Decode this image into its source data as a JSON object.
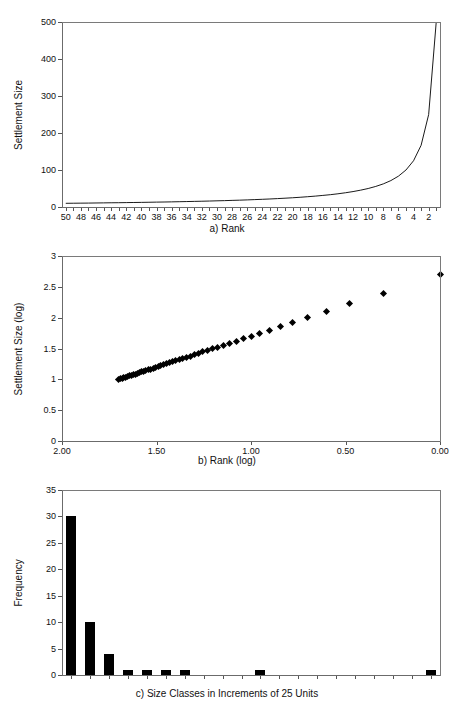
{
  "figure": {
    "background": "#ffffff",
    "axis_color": "#6b6b6b",
    "data_color": "#000000"
  },
  "chart_data": [
    {
      "id": "panel-a",
      "type": "line",
      "title": "",
      "caption": "a) Rank",
      "xlabel": "a) Rank",
      "ylabel": "Settlement Size",
      "xlim": [
        50.5,
        0.5
      ],
      "ylim": [
        0,
        500
      ],
      "x_reversed": true,
      "grid": false,
      "legend": "none",
      "yticks": [
        0,
        100,
        200,
        300,
        400,
        500
      ],
      "ytick_labels": [
        "0",
        "100",
        "200",
        "300",
        "400",
        "500"
      ],
      "xticks": [
        50,
        49,
        48,
        47,
        46,
        45,
        44,
        43,
        42,
        41,
        40,
        39,
        38,
        37,
        36,
        35,
        34,
        33,
        32,
        31,
        30,
        29,
        28,
        27,
        26,
        25,
        24,
        23,
        22,
        21,
        20,
        19,
        18,
        17,
        16,
        15,
        14,
        13,
        12,
        11,
        10,
        9,
        8,
        7,
        6,
        5,
        4,
        3,
        2,
        1
      ],
      "xtick_labels": [
        "50",
        "48",
        "46",
        "44",
        "42",
        "40",
        "38",
        "36",
        "34",
        "32",
        "30",
        "28",
        "26",
        "24",
        "22",
        "20",
        "18",
        "16",
        "14",
        "12",
        "10",
        "8",
        "6",
        "4",
        "2"
      ],
      "series": [
        {
          "name": "Rank-size curve",
          "x": [
            50,
            49,
            48,
            47,
            46,
            45,
            44,
            43,
            42,
            41,
            40,
            39,
            38,
            37,
            36,
            35,
            34,
            33,
            32,
            31,
            30,
            29,
            28,
            27,
            26,
            25,
            24,
            23,
            22,
            21,
            20,
            19,
            18,
            17,
            16,
            15,
            14,
            13,
            12,
            11,
            10,
            9,
            8,
            7,
            6,
            5,
            4,
            3,
            2,
            1
          ],
          "y": [
            10,
            10.2,
            10.4,
            10.6,
            10.9,
            11.1,
            11.4,
            11.6,
            11.9,
            12.2,
            12.5,
            12.8,
            13.2,
            13.5,
            13.9,
            14.3,
            14.7,
            15.2,
            15.6,
            16.1,
            16.7,
            17.2,
            17.9,
            18.5,
            19.2,
            20,
            20.8,
            21.7,
            22.7,
            23.8,
            25,
            26.3,
            27.8,
            29.4,
            31.3,
            33.3,
            35.7,
            38.5,
            41.7,
            45.5,
            50,
            55.6,
            62.5,
            71.4,
            83.3,
            100,
            125,
            166.7,
            250,
            500
          ]
        }
      ]
    },
    {
      "id": "panel-b",
      "type": "scatter",
      "title": "",
      "caption": "b) Rank (log)",
      "xlabel": "b) Rank (log)",
      "ylabel": "Settlement Size (log)",
      "xlim": [
        2.0,
        0.0
      ],
      "ylim": [
        0,
        3
      ],
      "x_reversed": true,
      "grid": false,
      "legend": "none",
      "yticks": [
        0,
        0.5,
        1,
        1.5,
        2,
        2.5,
        3
      ],
      "ytick_labels": [
        "0",
        "0.5",
        "1",
        "1.5",
        "2",
        "2.5",
        "3"
      ],
      "xticks": [
        2.0,
        1.5,
        1.0,
        0.5,
        0.0
      ],
      "xtick_labels": [
        "2.00",
        "1.50",
        "1.00",
        "0.50",
        "0.00"
      ],
      "marker": "diamond",
      "series": [
        {
          "name": "log Rank vs log Settlement Size",
          "x": [
            1.699,
            1.69,
            1.681,
            1.672,
            1.663,
            1.653,
            1.643,
            1.633,
            1.623,
            1.613,
            1.602,
            1.591,
            1.58,
            1.568,
            1.556,
            1.544,
            1.531,
            1.518,
            1.505,
            1.491,
            1.477,
            1.462,
            1.447,
            1.431,
            1.415,
            1.398,
            1.38,
            1.362,
            1.342,
            1.322,
            1.301,
            1.279,
            1.255,
            1.23,
            1.204,
            1.176,
            1.146,
            1.114,
            1.079,
            1.041,
            1.0,
            0.954,
            0.903,
            0.845,
            0.778,
            0.699,
            0.602,
            0.477,
            0.301,
            0.0
          ],
          "y": [
            1.0,
            1.009,
            1.017,
            1.026,
            1.036,
            1.046,
            1.057,
            1.065,
            1.076,
            1.086,
            1.097,
            1.107,
            1.121,
            1.13,
            1.143,
            1.155,
            1.167,
            1.182,
            1.193,
            1.207,
            1.223,
            1.236,
            1.253,
            1.267,
            1.283,
            1.301,
            1.318,
            1.336,
            1.356,
            1.377,
            1.398,
            1.42,
            1.444,
            1.468,
            1.496,
            1.522,
            1.553,
            1.585,
            1.62,
            1.658,
            1.699,
            1.745,
            1.796,
            1.854,
            1.921,
            2.0,
            2.097,
            2.222,
            2.398,
            2.699
          ]
        }
      ]
    },
    {
      "id": "panel-c",
      "type": "bar",
      "title": "",
      "caption": "c) Size Classes in Increments of 25 Units",
      "xlabel": "c) Size Classes in Increments of 25 Units",
      "ylabel": "Frequency",
      "ylim": [
        0,
        35
      ],
      "grid": false,
      "legend": "none",
      "yticks": [
        0,
        5,
        10,
        15,
        20,
        25,
        30,
        35
      ],
      "ytick_labels": [
        "0",
        "5",
        "10",
        "15",
        "20",
        "25",
        "30",
        "35"
      ],
      "categories": [
        "1",
        "2",
        "3",
        "4",
        "5",
        "6",
        "7",
        "8",
        "9",
        "10",
        "11",
        "12",
        "13",
        "14",
        "15",
        "16",
        "17",
        "18",
        "19",
        "20"
      ],
      "values": [
        30,
        10,
        4,
        1,
        1,
        1,
        1,
        0,
        0,
        0,
        1,
        0,
        0,
        0,
        0,
        0,
        0,
        0,
        0,
        1
      ]
    }
  ]
}
